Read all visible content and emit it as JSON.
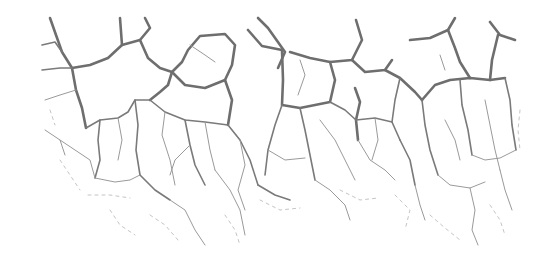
{
  "image": {
    "subject": "cracked-surface-texture",
    "background_color": "#ffffff",
    "crack_color": "#6e6e6e",
    "faint_crack_color": "#bdbdbd"
  }
}
